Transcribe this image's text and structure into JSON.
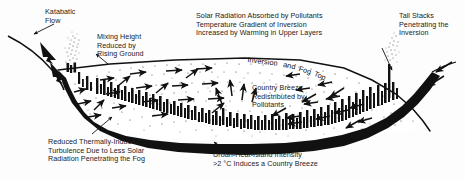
{
  "diagram": {
    "background_color": "#fdfdfd",
    "ink_color": "#111111"
  },
  "labels": {
    "katabatic_flow": "Katabatic\nFlow",
    "mixing_height": "Mixing Height\nReduced by\nRising Ground",
    "solar_radiation": "Solar Radiation Absorbed by Pollutants\nTemperature Gradient of Inversion\nIncreased by Warming in Upper Layers",
    "tall_stacks": "Tall Stacks\nPenetrating the\nInversion",
    "inversion_top_1": "Inversion",
    "inversion_top_2": "and",
    "inversion_top_3": "Fog",
    "inversion_top_4": "Top",
    "country_breeze": "Country Breeze\nRedistributed by\nPollutants",
    "reduced_turbulence": "Reduced Thermally-Induced\nTurbulence Due to Less Solar\nRadiation Penetrating the Fog",
    "urban_heat_island": "Urban-Heat-Island Intensity\n>2 °C Induces a Country Breeze"
  },
  "features": {
    "fog_layer": "stippled-fog-layer",
    "city_skyline": "city-skyline-silhouette",
    "basin_floor": "valley-basin-floor",
    "left_plume": "smoke-plume-left-ridge",
    "right_plume": "smoke-plume-tall-stack",
    "inversion_line": "inversion-boundary-line",
    "breeze_arrows": "converging-breeze-arrows"
  }
}
